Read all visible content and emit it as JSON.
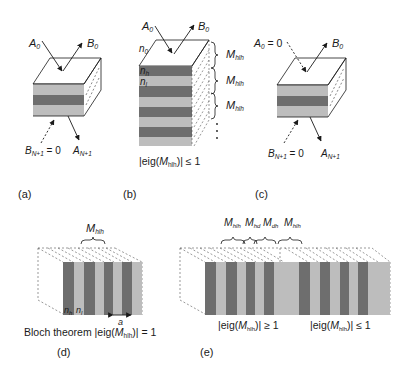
{
  "colors": {
    "background": "#ffffff",
    "light_layer": "#bdbdbd",
    "dark_layer": "#6e6e6e",
    "line": "#1a1a1a",
    "dashed": "#555555"
  },
  "panels": {
    "a": {
      "caption": "(a)",
      "A0": "A",
      "A0_sub": "0",
      "B0": "B",
      "B0_sub": "0",
      "BN1": "B",
      "BN1_sub": "N+1",
      "BN1_eq": " = 0",
      "AN1": "A",
      "AN1_sub": "N+1"
    },
    "b": {
      "caption": "(b)",
      "A0": "A",
      "A0_sub": "0",
      "B0": "B",
      "B0_sub": "0",
      "n0": "n",
      "n0_sub": "0",
      "nh": "n",
      "nh_sub": "h",
      "nl": "n",
      "nl_sub": "l",
      "M_labels": [
        {
          "base": "M",
          "sub": "hlh"
        },
        {
          "base": "M",
          "sub": "hlh"
        },
        {
          "base": "M",
          "sub": "hlh"
        }
      ],
      "eig_prefix": "|eig(",
      "eig_M": "M",
      "eig_sub": "hlh",
      "eig_suffix": ")| ≤ 1"
    },
    "c": {
      "caption": "(c)",
      "A0": "A",
      "A0_sub": "0",
      "A0_eq": " = 0",
      "B0": "B",
      "B0_sub": "0",
      "BN1": "B",
      "BN1_sub": "N+1",
      "BN1_eq": " = 0",
      "AN1": "A",
      "AN1_sub": "N+1"
    },
    "d": {
      "caption": "(d)",
      "M_label": {
        "base": "M",
        "sub": "hlh"
      },
      "nh": "n",
      "nh_sub": "h",
      "nl": "n",
      "nl_sub": "l",
      "period": "a",
      "bloch_prefix": "Bloch theorem |eig(",
      "bloch_M": "M",
      "bloch_sub": "hlh",
      "bloch_suffix": ")| = 1"
    },
    "e": {
      "caption": "(e)",
      "M_labels": [
        {
          "base": "M",
          "sub": "hlh"
        },
        {
          "base": "M",
          "sub": "hd"
        },
        {
          "base": "M",
          "sub": "dh"
        },
        {
          "base": "M",
          "sub": "hlh"
        }
      ],
      "eig_left_prefix": "|eig(",
      "eig_left_M": "M",
      "eig_left_sub": "hlh",
      "eig_left_suffix": ")| ≥ 1",
      "eig_right_prefix": "|eig(",
      "eig_right_M": "M",
      "eig_right_sub": "hlh",
      "eig_right_suffix": ")| ≤ 1"
    }
  }
}
